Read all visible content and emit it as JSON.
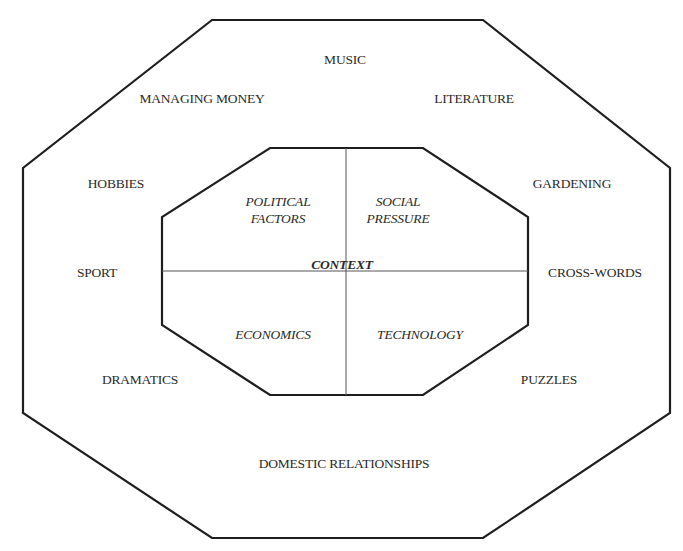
{
  "diagram": {
    "outer_ring": {
      "labels": [
        {
          "id": "music",
          "text": "MUSIC"
        },
        {
          "id": "managing-money",
          "text": "MANAGING MONEY"
        },
        {
          "id": "literature",
          "text": "LITERATURE"
        },
        {
          "id": "hobbies",
          "text": "HOBBIES"
        },
        {
          "id": "gardening",
          "text": "GARDENING"
        },
        {
          "id": "sport",
          "text": "SPORT"
        },
        {
          "id": "cross-words",
          "text": "CROSS-WORDS"
        },
        {
          "id": "dramatics",
          "text": "DRAMATICS"
        },
        {
          "id": "puzzles",
          "text": "PUZZLES"
        },
        {
          "id": "domestic-relationships",
          "text": "DOMESTIC RELATIONSHIPS"
        }
      ]
    },
    "inner_core": {
      "center_label": "CONTEXT",
      "quadrants": [
        {
          "id": "political-factors",
          "line1": "POLITICAL",
          "line2": "FACTORS"
        },
        {
          "id": "social-pressure",
          "line1": "SOCIAL",
          "line2": "PRESSURE"
        },
        {
          "id": "economics",
          "line1": "ECONOMICS"
        },
        {
          "id": "technology",
          "line1": "TECHNOLOGY"
        }
      ]
    },
    "colors": {
      "line": "#1e1e1e",
      "divider": "#555555",
      "text": "#2a2a2a"
    }
  }
}
